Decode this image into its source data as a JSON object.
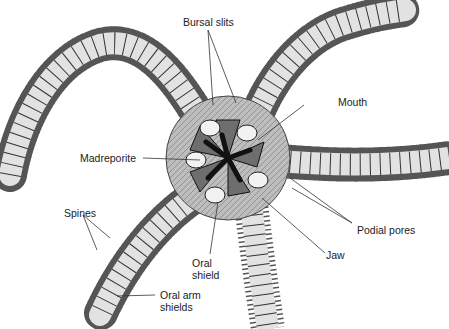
{
  "figure": {
    "colors": {
      "arm_fill": "#e2e2e2",
      "arm_stroke": "#333333",
      "disk_fill": "#bdbdbd",
      "jaw_fill": "#6e6e6e",
      "mouth_dark": "#111111",
      "oral_shield_fill": "#f2f2f2",
      "label_text": "#222222",
      "leader_line": "#333333"
    },
    "labels": {
      "bursal_slits": "Bursal slits",
      "mouth": "Mouth",
      "madreporite": "Madreporite",
      "podial_pores": "Podial pores",
      "jaw": "Jaw",
      "spines": "Spines",
      "oral_shield": "Oral\nshield",
      "oral_arm_shields": "Oral arm\nshields"
    }
  }
}
